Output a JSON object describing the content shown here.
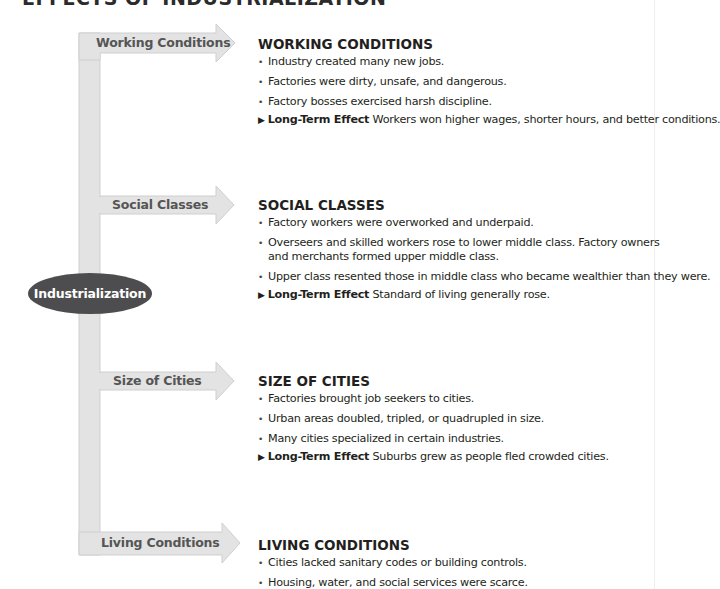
{
  "page": {
    "title": "EFFECTS OF INDUSTRIALIZATION"
  },
  "diagram": {
    "hub_label": "Industrialization",
    "colors": {
      "arrow_fill": "#e3e3e3",
      "arrow_stroke": "#cfcfcf",
      "hub_fill": "#4d4d4f",
      "hub_text": "#ffffff",
      "arrow_text": "#555555"
    },
    "branches": [
      {
        "label": "Working Conditions"
      },
      {
        "label": "Social Classes"
      },
      {
        "label": "Size of Cities"
      },
      {
        "label": "Living Conditions"
      }
    ]
  },
  "sections": [
    {
      "heading": "WORKING CONDITIONS",
      "bullets": [
        "Industry created many new jobs.",
        "Factories were dirty, unsafe, and dangerous.",
        "Factory bosses exercised harsh discipline."
      ],
      "effect_marker": "▶",
      "effect_label": "Long-Term Effect",
      "effect_text": " Workers won higher wages, shorter hours, and better conditions."
    },
    {
      "heading": "SOCIAL CLASSES",
      "bullets": [
        "Factory workers were overworked and underpaid.",
        "Overseers and skilled workers rose to lower middle class. Factory owners and merchants formed upper middle class.",
        "Upper class resented those in middle class who became wealthier than they were."
      ],
      "effect_marker": "▶",
      "effect_label": "Long-Term Effect",
      "effect_text": " Standard of living generally rose."
    },
    {
      "heading": "SIZE OF CITIES",
      "bullets": [
        "Factories brought job seekers to cities.",
        "Urban areas doubled, tripled, or quadrupled in size.",
        "Many cities specialized in certain industries."
      ],
      "effect_marker": "▶",
      "effect_label": "Long-Term Effect",
      "effect_text": " Suburbs grew as people fled crowded cities."
    },
    {
      "heading": "LIVING CONDITIONS",
      "bullets": [
        "Cities lacked sanitary codes or building controls.",
        "Housing, water, and social services were scarce."
      ]
    }
  ]
}
